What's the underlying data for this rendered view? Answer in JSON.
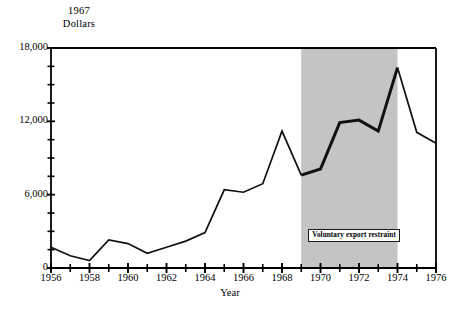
{
  "chart_data": {
    "type": "line",
    "title": "",
    "ylabel": "1967 Dollars",
    "xlabel": "Year",
    "ylim": [
      0,
      18000
    ],
    "xlim": [
      1956,
      1976
    ],
    "grid": false,
    "legend": "none",
    "y_ticks_major": [
      "0",
      "6,000",
      "12,000",
      "18,000"
    ],
    "y_tick_major_values": [
      0,
      6000,
      12000,
      18000
    ],
    "y_tick_minor_values": [
      1500,
      3000,
      4500,
      7500,
      9000,
      10500,
      13500,
      15000,
      16500
    ],
    "x_tick_labels": [
      "1956",
      "1958",
      "1960",
      "1962",
      "1964",
      "1966",
      "1968",
      "1970",
      "1972",
      "1974",
      "1976"
    ],
    "x_tick_label_values": [
      1956,
      1958,
      1960,
      1962,
      1964,
      1966,
      1968,
      1970,
      1972,
      1974,
      1976
    ],
    "x": [
      1956,
      1957,
      1958,
      1959,
      1960,
      1961,
      1962,
      1963,
      1964,
      1965,
      1966,
      1967,
      1968,
      1969,
      1970,
      1971,
      1972,
      1973,
      1974,
      1975,
      1976
    ],
    "values": [
      1700,
      1000,
      600,
      2300,
      2000,
      1200,
      1700,
      2200,
      2900,
      6400,
      6200,
      6900,
      11200,
      7600,
      8100,
      11900,
      12100,
      11200,
      16400,
      11100,
      10200
    ],
    "series": [
      {
        "name": "1967 Dollars",
        "values": [
          1700,
          1000,
          600,
          2300,
          2000,
          1200,
          1700,
          2200,
          2900,
          6400,
          6200,
          6900,
          11200,
          7600,
          8100,
          11900,
          12100,
          11200,
          16400,
          11100,
          10200
        ]
      }
    ],
    "shaded_region": {
      "label": "Voluntary export restraint",
      "x_start": 1969,
      "x_end": 1974,
      "color": "#c4c4c4"
    },
    "colors": {
      "line": "#111111",
      "frame": "#000000",
      "shade": "#c4c4c4",
      "background": "#ffffff"
    }
  }
}
